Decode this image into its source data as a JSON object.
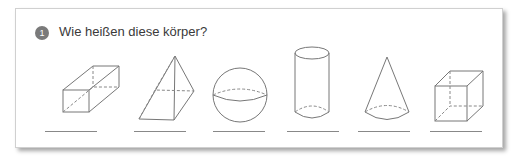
{
  "exercise": {
    "number": "1",
    "question": "Wie heißen diese körper?"
  },
  "shapes": [
    {
      "name": "quader",
      "icon": "cuboid-icon"
    },
    {
      "name": "pyramide",
      "icon": "pyramid-icon"
    },
    {
      "name": "kugel",
      "icon": "sphere-icon"
    },
    {
      "name": "zylinder",
      "icon": "cylinder-icon"
    },
    {
      "name": "kegel",
      "icon": "cone-icon"
    },
    {
      "name": "würfel",
      "icon": "cube-icon"
    }
  ],
  "answer_lines_count": 6,
  "colors": {
    "badge": "#7a7a7a",
    "line": "#888888",
    "text": "#3a3a3a"
  }
}
